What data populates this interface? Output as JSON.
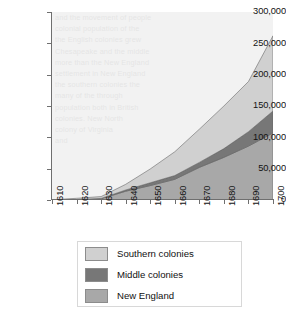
{
  "chart_data": {
    "type": "area",
    "stacked": true,
    "title": "",
    "xlabel": "",
    "ylabel": "",
    "x": [
      1610,
      1620,
      1630,
      1640,
      1650,
      1660,
      1670,
      1680,
      1690,
      1700
    ],
    "categories": [
      "1610",
      "1620",
      "1630",
      "1640",
      "1650",
      "1660",
      "1670",
      "1680",
      "1690",
      "1700"
    ],
    "xlim": [
      1610,
      1700
    ],
    "ylim": [
      0,
      300000
    ],
    "y_ticks": [
      0,
      50000,
      100000,
      150000,
      200000,
      250000,
      300000
    ],
    "y_tick_labels": [
      "0",
      "50,000",
      "100,000",
      "150,000",
      "200,000",
      "250,000",
      "300,000"
    ],
    "grid": false,
    "legend_position": "bottom",
    "series": [
      {
        "name": "New England",
        "color": "#a8a8a8",
        "values": [
          0,
          500,
          2000,
          14000,
          23000,
          33000,
          52000,
          68000,
          86000,
          107000
        ]
      },
      {
        "name": "Middle colonies",
        "color": "#777777",
        "values": [
          0,
          200,
          500,
          2000,
          4500,
          6000,
          8000,
          14000,
          23000,
          35000
        ]
      },
      {
        "name": "Southern colonies",
        "color": "#d0d0d0",
        "values": [
          350,
          2000,
          3000,
          9000,
          22000,
          38000,
          53000,
          68000,
          80000,
          120000
        ]
      }
    ],
    "series_order_bottom_to_top": [
      "New England",
      "Middle colonies",
      "Southern colonies"
    ],
    "totals": [
      350,
      2700,
      5500,
      25000,
      49500,
      77000,
      113000,
      150000,
      189000,
      262000
    ]
  },
  "legend": {
    "items": [
      {
        "label": "Southern colonies",
        "color": "#d0d0d0"
      },
      {
        "label": "Middle colonies",
        "color": "#777777"
      },
      {
        "label": "New England",
        "color": "#a8a8a8"
      }
    ]
  },
  "ghost_text": {
    "lines": [
      "and the movement of people",
      "colonial population of the",
      "the English colonies grew",
      "Chesapeake and the middle",
      "more than the New England",
      "settlement in New England",
      "the southern colonies the",
      "many of the through",
      "population both in British",
      "colonies. New North",
      "colony of Virginia",
      "and"
    ]
  }
}
